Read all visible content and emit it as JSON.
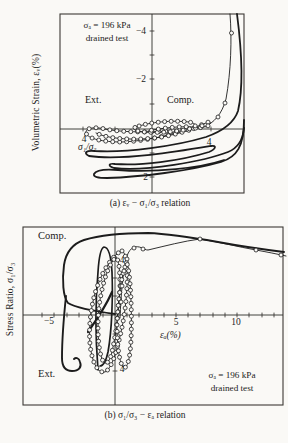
{
  "palette": {
    "ink": "#1c1c1c",
    "frame": "#3c3a36",
    "axis": "#2e2c29",
    "marker_fill": "#fbfaf7"
  },
  "chart_data": [
    {
      "id": "a",
      "type": "line",
      "caption": "(a) εᵥ − σ₁/σ₃ relation",
      "ylabel": "Volumetric Strain, εᵥ(%)",
      "xlabel_inline": "σ₁/σ₃",
      "annotation": {
        "line1": "σₐ = 196 kPa",
        "line2": "drained test"
      },
      "labels": {
        "ext": "Ext.",
        "comp": "Comp."
      },
      "axis_info": {
        "x": "stress ratio σ₁/σ₃; extension to the left of centre axis, compression to the right; labeled value 4 on each side",
        "y": "volumetric strain εᵥ (%), inverted axis; labeled ticks −4, −2 above origin and 2 below"
      },
      "x_tick_values": [
        4,
        4
      ],
      "y_tick_values": [
        -4,
        -2,
        2
      ],
      "geometry": {
        "frame": {
          "x": 60,
          "y": 14,
          "w": 184,
          "h": 179
        },
        "vaxis_x": 152,
        "haxis_y": 129,
        "hticks": [
          {
            "x": 83
          },
          {
            "x": 115
          },
          {
            "x": 190
          },
          {
            "x": 211
          }
        ],
        "vticks": [
          {
            "y": 31
          },
          {
            "y": 55
          },
          {
            "y": 79
          },
          {
            "y": 104
          },
          {
            "y": 153
          },
          {
            "y": 177
          }
        ]
      },
      "tick_labels": [
        {
          "x": 146,
          "y": 34,
          "t": "−4",
          "a": "end"
        },
        {
          "x": 146,
          "y": 82,
          "t": "−2",
          "a": "end"
        },
        {
          "x": 148,
          "y": 180,
          "t": "2",
          "a": "end"
        },
        {
          "x": 84,
          "y": 142,
          "t": "4",
          "a": "middle"
        },
        {
          "x": 209,
          "y": 145,
          "t": "4",
          "a": "middle"
        }
      ],
      "curves": [
        {
          "name": "thick-dilation-loop",
          "w": 1.8,
          "d": "M 237,14 C 241,45 244,85 238,111 C 234,123 223,131 206,137 C 176,146 126,153 95,151 C 86,150 83,153 89,156 C 122,161 181,151 211,146 C 217,145 216,149 209,152 C 180,161 140,166 115,164 C 108,163 108,166 114,168 C 145,172 205,161 228,152 C 238,148 243,139 244,128"
        },
        {
          "name": "thick-bottom-loop",
          "w": 1.8,
          "d": "M 244,120 C 244,146 237,157 221,162 C 190,171 140,177 107,178 C 98,178 93,177 94,174 C 96,170 106,169 118,170 C 155,173 200,168 224,160"
        },
        {
          "name": "marker-rise",
          "w": 0.9,
          "d": "M 230,14 C 232,38 231,72 226,99 C 222,114 214,123 204,127",
          "markers": [
            [
              231.5,
              33
            ],
            [
              225,
              103
            ],
            [
              218,
              117
            ]
          ]
        },
        {
          "name": "marker-loop-outer",
          "w": 0.9,
          "marker_every": 7,
          "d": "M 204,127 C 175,132 130,134 105,129 C 92,126 85,129 86,133 C 88,139 103,142 122,142 C 152,141 186,131 206,123 C 212,120 212,124 206,127"
        },
        {
          "name": "marker-loop-mid",
          "w": 0.9,
          "marker_every": 7,
          "d": "M 96,133 C 108,139 135,141 162,137 C 183,133 199,127 204,125"
        },
        {
          "name": "marker-loop-inner",
          "w": 0.9,
          "marker_every": 6.5,
          "d": "M 136,127 C 150,122 172,120 189,122 C 199,124 197,128 184,130 C 166,133 147,133 138,131 C 133,130 133,128 136,127"
        },
        {
          "name": "marker-loop-core",
          "w": 0.9,
          "marker_every": 7,
          "d": "M 148,131 C 162,128 180,126 193,127"
        }
      ]
    },
    {
      "id": "b",
      "type": "line",
      "caption": "(b) σ₁/σ₃ − εₐ relation",
      "ylabel": "Stress Ratio, σ₁/σ₃",
      "xlabel": "εₐ(%)",
      "annotation": {
        "line1": "σₐ = 196 kPa",
        "line2": "drained test"
      },
      "labels": {
        "ext": "Ext.",
        "comp": "Comp."
      },
      "axis_info": {
        "x": "axial strain εₐ (%); labeled ticks −5, 5, 10; minor ticks every 1%",
        "y": "stress ratio σ₁/σ₃; labeled value 4 above (compression) and 4 below (extension)"
      },
      "x_tick_values": [
        -5,
        5,
        10
      ],
      "y_tick_values": [
        4,
        4
      ],
      "geometry": {
        "frame": {
          "x": 23,
          "y": 227,
          "w": 260,
          "h": 178
        },
        "vaxis_x": 115,
        "haxis_y": 315,
        "hticks": [
          {
            "x": 42
          },
          {
            "x": 54
          },
          {
            "x": 67
          },
          {
            "x": 79
          },
          {
            "x": 91
          },
          {
            "x": 103
          },
          {
            "x": 127
          },
          {
            "x": 139
          },
          {
            "x": 152
          },
          {
            "x": 164
          },
          {
            "x": 176
          },
          {
            "x": 188
          },
          {
            "x": 200
          },
          {
            "x": 213
          },
          {
            "x": 225
          },
          {
            "x": 237
          },
          {
            "x": 249
          },
          {
            "x": 262
          },
          {
            "x": 274
          }
        ],
        "vticks": [
          {
            "y": 259
          },
          {
            "y": 278
          },
          {
            "y": 296
          },
          {
            "y": 334
          },
          {
            "y": 352
          },
          {
            "y": 371
          }
        ]
      },
      "tick_labels": [
        {
          "x": 49,
          "y": 324,
          "t": "−5",
          "a": "middle"
        },
        {
          "x": 176,
          "y": 325,
          "t": "5",
          "a": "middle"
        },
        {
          "x": 236,
          "y": 325,
          "t": "10",
          "a": "middle"
        },
        {
          "x": 122,
          "y": 263,
          "t": "4",
          "a": "middle"
        },
        {
          "x": 122,
          "y": 372,
          "t": "4",
          "a": "middle"
        }
      ],
      "curves": [
        {
          "name": "thick-outer-compression",
          "w": 1.9,
          "d": "M 115,314 C 100,312 78,309 68,303 C 63,297 62,280 64,265 C 66,252 72,244 84,240 C 100,235 125,233 148,233 C 172,234 195,238 218,242 C 245,247 268,250 284,252"
        },
        {
          "name": "thick-extension-branch",
          "w": 1.9,
          "d": "M 66,296 C 64,315 62,342 62,358 C 62,366 65,371 72,371 C 79,371 82,367 80,362 C 79,358 76,357 74,359"
        },
        {
          "name": "thick-inner-loop",
          "w": 1.7,
          "d": "M 98,370 C 96,345 95,305 98,272 C 99,256 101,248 104,247 C 108,247 111,255 112,272 C 113,295 112,330 108,352 C 106,361 103,366 100,366"
        },
        {
          "name": "thick-dense-diagonal",
          "w": 2.2,
          "d": "M 88,332 C 95,322 105,308 112,292"
        },
        {
          "name": "marker-loop-wide",
          "w": 0.9,
          "marker_every": 6.5,
          "d": "M 121,251 C 111,257 100,274 94,297 C 89,317 88,341 92,356 C 95,368 100,373 105,372 C 111,369 116,355 121,332 C 126,310 128,284 127,267 C 126,256 124,250 121,251 Z"
        },
        {
          "name": "marker-loop-mid",
          "w": 0.9,
          "marker_every": 6.5,
          "d": "M 116,257 C 108,265 102,284 99,307 C 97,328 98,348 102,359 C 105,366 109,364 112,352 C 116,334 119,309 120,287 C 120,271 119,260 116,257 Z"
        },
        {
          "name": "marker-loop-narrow",
          "w": 0.9,
          "marker_every": 6.5,
          "d": "M 126,264 C 121,277 118,301 117,324 C 117,345 119,361 123,367 C 127,370 130,360 131,340 C 132,317 131,289 129,273 C 128,266 127,262 126,264 Z"
        },
        {
          "name": "marker-reload-sweep",
          "w": 0.9,
          "d": "M 120,318 C 121,294 123,270 127,256 C 130,247 136,245 142,248 C 144,249 146,250 148,250 C 165,246 184,241 200,239 C 219,242 239,247 256,250 C 267,252 277,254 286,256",
          "markers": [
            [
              121,
              302
            ],
            [
              122,
              286
            ],
            [
              124,
              271
            ],
            [
              127,
              259
            ],
            [
              134,
              248
            ],
            [
              143,
              249
            ],
            [
              200,
              239
            ],
            [
              256,
              250
            ],
            [
              281,
              255
            ]
          ]
        }
      ]
    }
  ]
}
